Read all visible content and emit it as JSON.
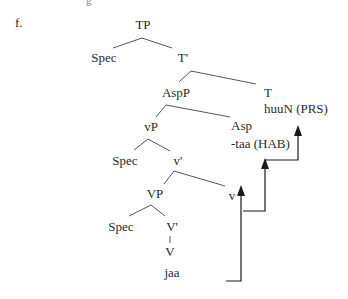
{
  "example_label": "f.",
  "top_fragment": "g",
  "tree": {
    "nodes": {
      "tp": "TP",
      "spec_tp": "Spec",
      "t_bar": "T'",
      "aspp": "AspP",
      "t_head": "T",
      "t_form": "huuN (PRS)",
      "vp_small": "vP",
      "asp_head": "Asp",
      "asp_form": "-taa (HAB)",
      "spec_vp_small": "Spec",
      "v_bar_small": "v'",
      "vp_big": "VP",
      "v_head_small": "v",
      "spec_vp_big": "Spec",
      "v_bar_big": "V'",
      "v_head_big": "V",
      "v_form": "jaa"
    },
    "movement_arrows": [
      {
        "from": "jaa",
        "to": "v"
      },
      {
        "from": "v",
        "to": "-taa (HAB)"
      },
      {
        "from": "-taa (HAB)",
        "to": "huuN (PRS)"
      }
    ]
  },
  "colors": {
    "line": "#555555",
    "arrow": "#1a1a1a",
    "text": "#2a2a2a"
  }
}
